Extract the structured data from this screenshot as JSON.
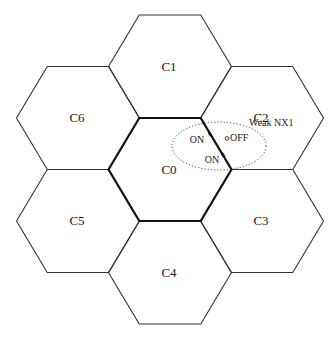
{
  "diagram": {
    "type": "hexagonal-cell-layout",
    "hex": {
      "half_width": 61.5,
      "half_height": 51.5,
      "edge_half": 30.75
    },
    "stroke_color": "#333333",
    "center_stroke_color": "#111111",
    "cells": [
      {
        "id": "C0",
        "label": "C0",
        "cx": 170,
        "cy": 169.5,
        "center": true
      },
      {
        "id": "C1",
        "label": "C1",
        "cx": 170,
        "cy": 66.5
      },
      {
        "id": "C2",
        "label": "C2",
        "cx": 262,
        "cy": 118
      },
      {
        "id": "C3",
        "label": "C3",
        "cx": 262,
        "cy": 221
      },
      {
        "id": "C4",
        "label": "C4",
        "cx": 170,
        "cy": 272.5
      },
      {
        "id": "C5",
        "label": "C5",
        "cx": 78,
        "cy": 221
      },
      {
        "id": "C6",
        "label": "C6",
        "cx": 78,
        "cy": 118
      }
    ],
    "region": {
      "label": "Weak NX1",
      "shape": "dotted-ellipse",
      "cx": 219,
      "cy": 146,
      "rx": 47,
      "ry": 24
    },
    "annotations": [
      {
        "text": "ON",
        "x": 197,
        "y": 143
      },
      {
        "text": "ON",
        "x": 212,
        "y": 163
      },
      {
        "text": "OFF",
        "x": 235,
        "y": 141,
        "marker": "open-circle"
      }
    ],
    "boundary_markers": [
      {
        "x": 210,
        "y": 134
      },
      {
        "x": 223,
        "y": 155
      }
    ]
  }
}
